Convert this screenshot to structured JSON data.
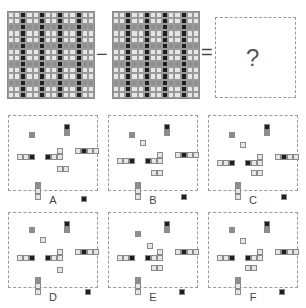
{
  "puzzle": {
    "operator_minus": "−",
    "operator_equals": "=",
    "question_mark": "?",
    "colors": {
      "light": "#e6e6e6",
      "gray": "#8e8e8e",
      "dark": "#1e1e1e",
      "border": "#8a8a8a"
    },
    "grid_size": 14
  },
  "options": [
    {
      "label": "A"
    },
    {
      "label": "B"
    },
    {
      "label": "C"
    },
    {
      "label": "D"
    },
    {
      "label": "E"
    },
    {
      "label": "F"
    }
  ]
}
